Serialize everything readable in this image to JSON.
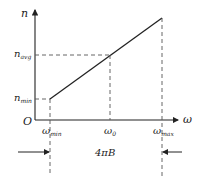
{
  "diagram": {
    "axes": {
      "y_label": "n",
      "x_label": "ω",
      "origin_label": "O"
    },
    "y_ticks": [
      {
        "base": "n",
        "sub": "avg"
      },
      {
        "base": "n",
        "sub": "min"
      }
    ],
    "x_ticks": [
      {
        "base": "ω",
        "sub": "min"
      },
      {
        "base": "ω",
        "sub": "0"
      },
      {
        "base": "ω",
        "sub": "max"
      }
    ],
    "span_label": "4πB",
    "line_color": "#222222",
    "dash_color": "#555555"
  }
}
